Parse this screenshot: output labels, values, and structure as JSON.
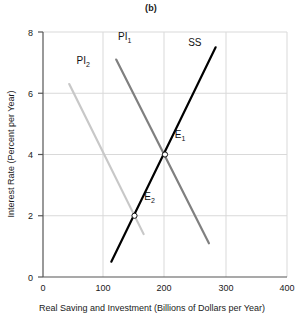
{
  "chart_data": {
    "type": "line",
    "title": "(b)",
    "xlabel": "Real Saving and Investment (Billions of Dollars per Year)",
    "ylabel": "Interest Rate (Percent per Year)",
    "xlim": [
      0,
      400
    ],
    "ylim": [
      0,
      8
    ],
    "xticks": [
      0,
      100,
      200,
      300,
      400
    ],
    "yticks": [
      0,
      2,
      4,
      6,
      8
    ],
    "xtick_labels": [
      "0",
      "100",
      "200",
      "300",
      "400"
    ],
    "ytick_labels": [
      "0",
      "2",
      "4",
      "6",
      "8"
    ],
    "grid": true,
    "legend": "none",
    "series": [
      {
        "name": "SS",
        "label": "SS",
        "label_base": "SS",
        "label_sub": "",
        "color": "#000000",
        "width": 2.2,
        "points": [
          [
            112,
            0.5
          ],
          [
            283,
            7.5
          ]
        ],
        "label_pos": [
          238,
          7.55
        ]
      },
      {
        "name": "PI1",
        "label": "PI1",
        "label_base": "PI",
        "label_sub": "1",
        "color": "#808080",
        "width": 2.2,
        "points": [
          [
            120,
            7.1
          ],
          [
            272,
            1.1
          ]
        ],
        "label_pos": [
          123,
          7.75
        ]
      },
      {
        "name": "PI2",
        "label": "PI2",
        "label_base": "PI",
        "label_sub": "2",
        "color": "#c8c8c8",
        "width": 2.2,
        "points": [
          [
            43,
            6.3
          ],
          [
            165,
            1.4
          ]
        ],
        "label_pos": [
          55,
          6.95
        ]
      }
    ],
    "annotations": [
      {
        "name": "E1",
        "label_base": "E",
        "label_sub": "1",
        "x": 200,
        "y": 4.0,
        "marker": "open-circle",
        "label_pos": [
          216,
          4.55
        ]
      },
      {
        "name": "E2",
        "label_base": "E",
        "label_sub": "2",
        "x": 150,
        "y": 2.0,
        "marker": "open-circle",
        "label_pos": [
          166,
          2.5
        ]
      }
    ]
  },
  "axes": {
    "grid_color": "#d9d9d9",
    "axis_color": "#555555"
  }
}
